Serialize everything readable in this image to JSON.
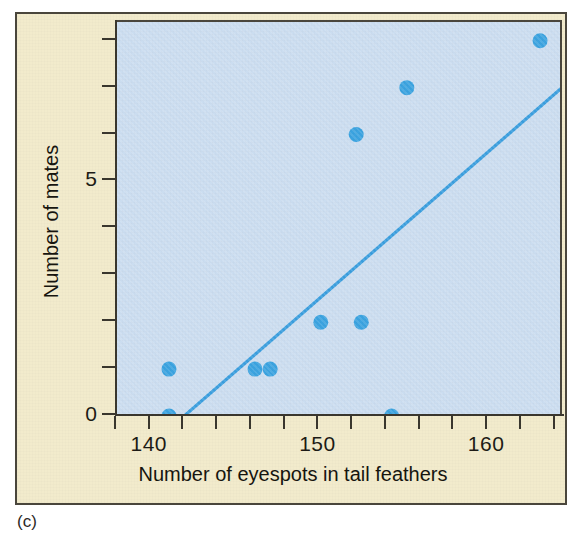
{
  "figure": {
    "caption": "(c)",
    "background_color": "#f2ebcc",
    "plot_background_color": "#cbddf0",
    "border_color": "#4a463c"
  },
  "chart_data": {
    "type": "scatter",
    "title": "",
    "xlabel": "Number of eyespots in tail feathers",
    "ylabel": "Number of mates",
    "xlim": [
      138,
      164.5
    ],
    "ylim": [
      0,
      8.4
    ],
    "grid": false,
    "legend": null,
    "marker_color": "#3ba3e0",
    "line_color": "#3a9ede",
    "x_tick_values": [
      138,
      140,
      142,
      144,
      146,
      148,
      150,
      152,
      154,
      156,
      158,
      160,
      162,
      164
    ],
    "x_tick_labels": [
      {
        "value": 140,
        "label": "140"
      },
      {
        "value": 150,
        "label": "150"
      },
      {
        "value": 160,
        "label": "160"
      }
    ],
    "y_tick_values": [
      0,
      1,
      2,
      3,
      4,
      5,
      6,
      7,
      8
    ],
    "y_tick_labels": [
      {
        "value": 0,
        "label": "0"
      },
      {
        "value": 5,
        "label": "5"
      }
    ],
    "points": [
      {
        "x": 141.2,
        "y": 0
      },
      {
        "x": 141.2,
        "y": 1
      },
      {
        "x": 146.3,
        "y": 1
      },
      {
        "x": 147.2,
        "y": 1
      },
      {
        "x": 150.2,
        "y": 2
      },
      {
        "x": 152.6,
        "y": 2
      },
      {
        "x": 152.3,
        "y": 6
      },
      {
        "x": 154.4,
        "y": 0
      },
      {
        "x": 155.3,
        "y": 7
      },
      {
        "x": 163.2,
        "y": 8
      }
    ],
    "trend_line": {
      "label": "regression line",
      "x_start": 142.1,
      "y_start": 0,
      "x_end": 164.5,
      "y_end": 7.0
    }
  }
}
